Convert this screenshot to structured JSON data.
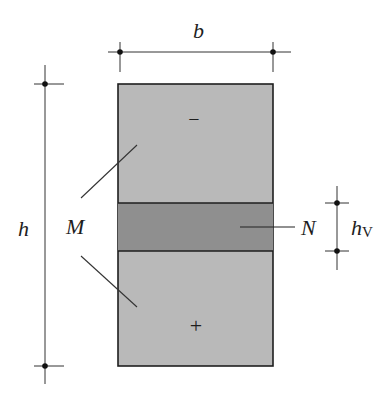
{
  "diagram": {
    "type": "cross-section",
    "colors": {
      "section_fill": "#b9b9b9",
      "band_fill": "#8f8f8f",
      "stroke": "#1e1e1e",
      "background": "#ffffff"
    },
    "labels": {
      "width": "b",
      "height": "h",
      "moment": "M",
      "normal_force": "N",
      "band_height_main": "h",
      "band_height_sub": "V",
      "compression_sign": "−",
      "tension_sign": "+"
    },
    "geometry": {
      "section": {
        "x": 118,
        "y": 84,
        "width": 155,
        "height": 282
      },
      "band": {
        "y_top": 203,
        "y_bottom": 251
      },
      "dim_b": {
        "y": 52,
        "x1": 120,
        "x2": 273
      },
      "dim_h": {
        "x": 45,
        "y1": 84,
        "y2": 366
      },
      "dim_hv": {
        "x": 337,
        "y1": 203,
        "y2": 251
      }
    }
  }
}
